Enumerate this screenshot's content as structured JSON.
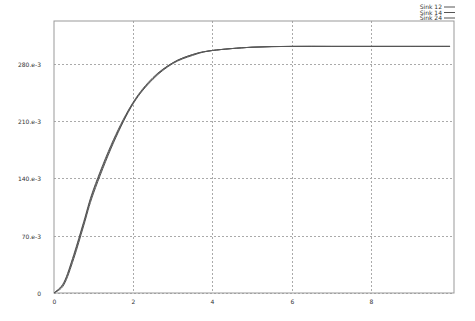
{
  "chart_data": {
    "type": "line",
    "title": "",
    "xlabel": "",
    "ylabel": "",
    "xlim": [
      0,
      10.1
    ],
    "ylim": [
      0,
      0.332
    ],
    "grid": true,
    "legend_position": "top-right",
    "x_ticks": [
      0,
      2,
      4,
      6,
      8
    ],
    "x_tick_labels": [
      "0",
      "2",
      "4",
      "6",
      "8"
    ],
    "y_ticks": [
      0,
      0.07,
      0.14,
      0.21,
      0.28
    ],
    "y_tick_labels": [
      "0",
      "70.e-3",
      "140.e-3",
      "210.e-3",
      "280.e-3"
    ],
    "x": [
      0,
      0.25,
      0.5,
      0.75,
      1.0,
      1.5,
      2.0,
      2.5,
      3.0,
      3.5,
      4.0,
      5.0,
      6.0,
      7.0,
      8.0,
      9.0,
      10.0
    ],
    "series": [
      {
        "name": "Sink 12",
        "values": [
          0,
          0.012,
          0.045,
          0.085,
          0.125,
          0.185,
          0.232,
          0.262,
          0.281,
          0.291,
          0.296,
          0.3,
          0.301,
          0.301,
          0.301,
          0.301,
          0.301
        ]
      },
      {
        "name": "Sink 14",
        "values": [
          0,
          0.013,
          0.047,
          0.087,
          0.127,
          0.187,
          0.233,
          0.263,
          0.281,
          0.291,
          0.296,
          0.3,
          0.301,
          0.301,
          0.301,
          0.301,
          0.301
        ]
      },
      {
        "name": "Sink 24",
        "values": [
          0,
          0.01,
          0.042,
          0.082,
          0.122,
          0.183,
          0.231,
          0.261,
          0.28,
          0.29,
          0.296,
          0.3,
          0.301,
          0.301,
          0.301,
          0.301,
          0.301
        ]
      }
    ]
  },
  "legend": {
    "items": [
      {
        "label": "Sink 12"
      },
      {
        "label": "Sink 14"
      },
      {
        "label": "Sink 24"
      }
    ]
  },
  "colors": {
    "line": "#555555",
    "grid": "#aaaaaa",
    "axis": "#888888"
  }
}
